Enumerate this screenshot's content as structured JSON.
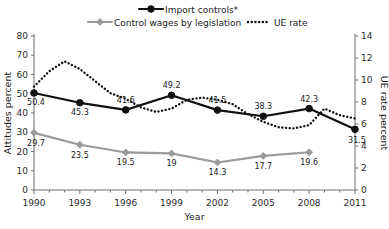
{
  "chart_data": {
    "type": "line",
    "title": "",
    "xlabel": "Year",
    "ylabel": "Attitudes percent",
    "y2label": "UE rate percent",
    "x": [
      1990,
      1991,
      1992,
      1993,
      1994,
      1995,
      1996,
      1997,
      1998,
      1999,
      2000,
      2001,
      2002,
      2003,
      2004,
      2005,
      2006,
      2007,
      2008,
      2009,
      2010,
      2011
    ],
    "xlim": [
      1990,
      2011
    ],
    "ylim": [
      0,
      80
    ],
    "y2lim": [
      0,
      14
    ],
    "yticks": [
      0,
      10,
      20,
      30,
      40,
      50,
      60,
      70,
      80
    ],
    "y2ticks": [
      0,
      2,
      4,
      6,
      8,
      10,
      12,
      14
    ],
    "xticks": [
      1990,
      1993,
      1996,
      1999,
      2002,
      2005,
      2008,
      2011
    ],
    "grid": false,
    "legend_position": "top",
    "series": [
      {
        "name": "Import controls*",
        "axis": "left",
        "color": "#111111",
        "style": "solid",
        "marker": "circle",
        "x": [
          1990,
          1993,
          1996,
          1999,
          2002,
          2005,
          2008,
          2011
        ],
        "values": [
          50.4,
          45.3,
          41.6,
          49.2,
          41.5,
          38.3,
          42.3,
          31.5
        ],
        "point_labels": [
          "50.4",
          "45.3",
          "41.6",
          "49.2",
          "41.5",
          "38.3",
          "42.3",
          "31.5"
        ]
      },
      {
        "name": "Control wages by legislation",
        "axis": "left",
        "color": "#9a9a9a",
        "style": "solid",
        "marker": "diamond",
        "x": [
          1990,
          1993,
          1996,
          1999,
          2002,
          2005,
          2008
        ],
        "values": [
          29.7,
          23.5,
          19.5,
          19.0,
          14.3,
          17.7,
          19.6
        ],
        "point_labels": [
          "29.7",
          "23.5",
          "19.5",
          "19",
          "14.3",
          "17.7",
          "19.6"
        ]
      },
      {
        "name": "UE rate",
        "axis": "right",
        "color": "#111111",
        "style": "dotted",
        "marker": "none",
        "x": [
          1990,
          1991,
          1992,
          1993,
          1994,
          1995,
          1996,
          1997,
          1998,
          1999,
          2000,
          2001,
          2002,
          2003,
          2004,
          2005,
          2006,
          2007,
          2008,
          2009,
          2010,
          2011
        ],
        "values": [
          9.4,
          10.8,
          11.7,
          11.0,
          9.9,
          8.8,
          8.3,
          7.5,
          7.1,
          7.4,
          8.2,
          8.4,
          8.2,
          7.8,
          6.9,
          6.2,
          5.7,
          5.6,
          5.9,
          7.4,
          6.8,
          6.5
        ]
      }
    ],
    "legend": [
      {
        "label": "Import controls*",
        "color": "#111111",
        "style": "solid",
        "marker": "circle"
      },
      {
        "label": "Control wages by legislation",
        "color": "#9a9a9a",
        "style": "solid",
        "marker": "diamond"
      },
      {
        "label": "UE rate",
        "color": "#111111",
        "style": "dotted",
        "marker": "none"
      }
    ],
    "left_axis_zero_label": "0",
    "right_axis_zero_label": "0"
  }
}
